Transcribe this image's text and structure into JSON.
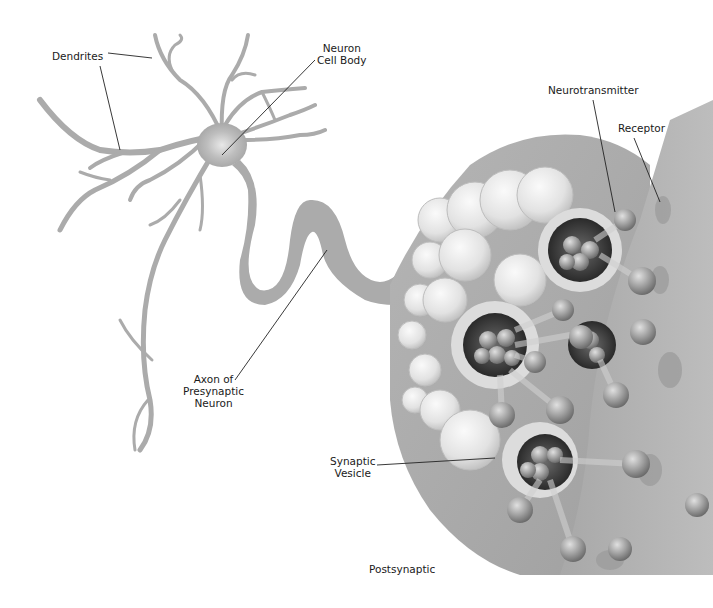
{
  "diagram": {
    "type": "neuron-synapse-illustration",
    "colors": {
      "tissue": "#a9a9a9",
      "tissue_dark": "#8f8f8f",
      "vesicle_light": "#e6e6e6",
      "vesicle_dark": "#3a3a3a",
      "molecule": "#9a9a9a",
      "leader_line": "#222222",
      "label_text": "#1a1a1a",
      "background": "#ffffff"
    },
    "labels": {
      "dendrites": "Dendrites",
      "cell_body": "Neuron\nCell Body",
      "neurotransmitter": "Neurotransmitter",
      "receptor": "Receptor",
      "axon": "Axon of\nPresynaptic\nNeuron",
      "synaptic_vesicle": "Synaptic\nVesicle",
      "postsynaptic": "Postsynaptic"
    }
  }
}
